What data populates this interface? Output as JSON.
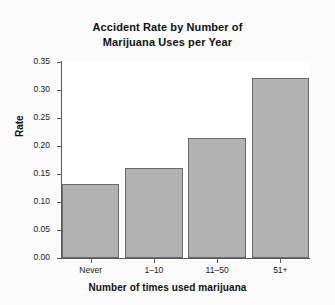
{
  "chart_data": {
    "type": "bar",
    "title": "Accident Rate by Number of Marijuana Uses per Year",
    "title_lines": [
      "Accident Rate by Number of",
      "Marijuana Uses per Year"
    ],
    "categories": [
      "Never",
      "1–10",
      "11–50",
      "51+"
    ],
    "values": [
      0.133,
      0.16,
      0.215,
      0.322
    ],
    "xlabel": "Number of times used marijuana",
    "ylabel": "Rate",
    "ylim": [
      0.0,
      0.35
    ],
    "ytick_labels": [
      "0.35",
      "0.30",
      "0.25",
      "0.20",
      "0.15",
      "0.10",
      "0.05",
      "0.00"
    ],
    "ytick_values": [
      0.35,
      0.3,
      0.25,
      0.2,
      0.15,
      0.1,
      0.05,
      0.0
    ],
    "grid": false,
    "legend": null,
    "bar_color": "#b2b2b2",
    "bar_edge_color": "#6b6b6b",
    "plot_background": "#ffffff",
    "figure_background": "#fbfbfb"
  }
}
